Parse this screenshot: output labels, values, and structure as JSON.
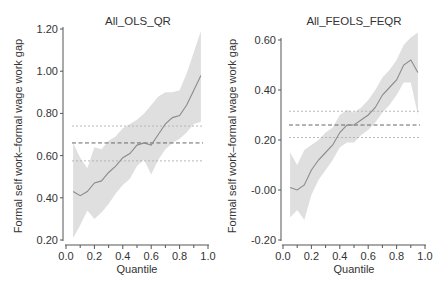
{
  "chart_data": [
    {
      "type": "line",
      "title": "All_OLS_QR",
      "xlabel": "Quantile",
      "ylabel": "Formal self work–formal wage work gap",
      "xlim": [
        0.0,
        1.0
      ],
      "ylim": [
        0.2,
        1.2
      ],
      "xticks": [
        "0.0",
        "0.2",
        "0.4",
        "0.6",
        "0.8",
        "1.0"
      ],
      "yticks": [
        "0.20",
        "0.40",
        "0.60",
        "0.80",
        "1.00",
        "1.20"
      ],
      "grid": false,
      "series": [
        {
          "name": "QR estimate",
          "x": [
            0.05,
            0.1,
            0.15,
            0.2,
            0.25,
            0.3,
            0.35,
            0.4,
            0.45,
            0.5,
            0.55,
            0.6,
            0.65,
            0.7,
            0.75,
            0.8,
            0.85,
            0.9,
            0.95
          ],
          "y": [
            0.43,
            0.41,
            0.43,
            0.47,
            0.48,
            0.52,
            0.55,
            0.59,
            0.61,
            0.65,
            0.66,
            0.65,
            0.7,
            0.75,
            0.78,
            0.79,
            0.84,
            0.91,
            0.98
          ],
          "ci_lower": [
            0.21,
            0.27,
            0.34,
            0.3,
            0.33,
            0.37,
            0.42,
            0.46,
            0.49,
            0.55,
            0.58,
            0.51,
            0.58,
            0.63,
            0.66,
            0.68,
            0.71,
            0.75,
            0.76
          ],
          "ci_upper": [
            0.66,
            0.59,
            0.54,
            0.64,
            0.63,
            0.67,
            0.69,
            0.73,
            0.75,
            0.77,
            0.8,
            0.84,
            0.88,
            0.9,
            0.9,
            0.91,
            0.99,
            1.09,
            1.19
          ]
        },
        {
          "name": "OLS estimate",
          "style": "dashed",
          "y": 0.66
        },
        {
          "name": "OLS CI upper",
          "style": "dotted",
          "y": 0.74
        },
        {
          "name": "OLS CI lower",
          "style": "dotted",
          "y": 0.575
        }
      ]
    },
    {
      "type": "line",
      "title": "All_FEOLS_FEQR",
      "xlabel": "Quantile",
      "ylabel": "Formal self work–formal wage work gap",
      "xlim": [
        0.0,
        1.0
      ],
      "ylim": [
        -0.2,
        0.6
      ],
      "xticks": [
        "0.0",
        "0.2",
        "0.4",
        "0.6",
        "0.8",
        "1.0"
      ],
      "yticks": [
        "-0.20",
        "-0.00",
        "0.20",
        "0.40",
        "0.60"
      ],
      "grid": false,
      "series": [
        {
          "name": "FEQR estimate",
          "x": [
            0.05,
            0.1,
            0.15,
            0.2,
            0.25,
            0.3,
            0.35,
            0.4,
            0.45,
            0.5,
            0.55,
            0.6,
            0.65,
            0.7,
            0.75,
            0.8,
            0.85,
            0.9,
            0.95
          ],
          "y": [
            0.01,
            0.0,
            0.02,
            0.08,
            0.12,
            0.15,
            0.18,
            0.23,
            0.26,
            0.26,
            0.28,
            0.3,
            0.33,
            0.38,
            0.41,
            0.44,
            0.5,
            0.52,
            0.47
          ],
          "ci_lower": [
            -0.11,
            -0.08,
            -0.12,
            -0.02,
            0.04,
            0.08,
            0.12,
            0.17,
            0.19,
            0.19,
            0.22,
            0.24,
            0.27,
            0.31,
            0.34,
            0.38,
            0.43,
            0.43,
            0.3
          ],
          "ci_upper": [
            0.15,
            0.1,
            0.16,
            0.18,
            0.2,
            0.23,
            0.25,
            0.3,
            0.32,
            0.31,
            0.33,
            0.36,
            0.4,
            0.45,
            0.48,
            0.52,
            0.58,
            0.61,
            0.63
          ]
        },
        {
          "name": "FEOLS estimate",
          "style": "dashed",
          "y": 0.26
        },
        {
          "name": "FEOLS CI upper",
          "style": "dotted",
          "y": 0.315
        },
        {
          "name": "FEOLS CI lower",
          "style": "dotted",
          "y": 0.21
        }
      ]
    }
  ],
  "colors": {
    "ci_band": "#d9d9d9",
    "estimate_line": "#8c8c8c",
    "dashed_line": "#666666",
    "dotted_line": "#b0b0b0",
    "axis": "#555555",
    "text": "#333333"
  }
}
